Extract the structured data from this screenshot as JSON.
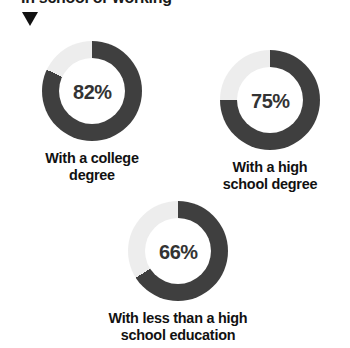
{
  "headline": {
    "text": "In school or working",
    "clipped": true
  },
  "marker": {
    "icon": "triangle-down-icon"
  },
  "colors": {
    "arc_filled": "#3f3f3f",
    "arc_remainder": "#ededed",
    "text_dark": "#111111",
    "percent_text": "#333333",
    "background": "#ffffff"
  },
  "chart_data": {
    "type": "pie",
    "title": "In school or working",
    "subtype": "donut",
    "units": "percent",
    "start_angle_deg": 0,
    "direction": "clockwise",
    "categories": [
      "With a college degree",
      "With a high school degree",
      "With less than a high school education"
    ],
    "values": [
      82,
      75,
      66
    ],
    "value_labels": [
      "82%",
      "75%",
      "66%"
    ],
    "remainder_values": [
      18,
      25,
      34
    ],
    "legend": "none",
    "grid": false,
    "xlabel": "",
    "ylabel": "",
    "series": [
      {
        "name": "In school or working",
        "values": [
          82,
          75,
          66
        ]
      }
    ]
  },
  "donuts": [
    {
      "id": "college",
      "percent_label": "82%",
      "value": 82,
      "caption_line1": "With a college",
      "caption_line2": "degree"
    },
    {
      "id": "highschool",
      "percent_label": "75%",
      "value": 75,
      "caption_line1": "With a high",
      "caption_line2": "school degree"
    },
    {
      "id": "lessthan",
      "percent_label": "66%",
      "value": 66,
      "caption_line1": "With less than a high",
      "caption_line2": "school education"
    }
  ]
}
